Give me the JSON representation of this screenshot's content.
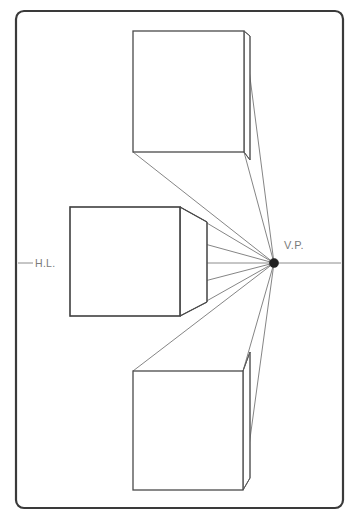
{
  "diagram": {
    "canvas": {
      "width": 357,
      "height": 519,
      "background": "#ffffff"
    },
    "frame": {
      "name": "page-border",
      "x": 16,
      "y": 11,
      "width": 327,
      "height": 497,
      "corner_radius": 8,
      "stroke": "#3a3a3a",
      "stroke_width": 2.2
    },
    "labels": {
      "vanishing_point": "V.P.",
      "horizon_line": "H.L."
    },
    "colors": {
      "frame": "#3a3a3a",
      "cube_stroke": "#4a4a4a",
      "ray_stroke": "#6f6f6f",
      "horizon_stroke": "#8c8c8c",
      "label_text": "#7b7b7b",
      "vp_dot": "#202020",
      "background": "#ffffff"
    },
    "vanishing_point": {
      "x": 274,
      "y": 263,
      "radius": 4.6
    },
    "horizon": {
      "y": 263,
      "x_start": 18,
      "x_end": 341,
      "label_gap_start": 33,
      "label_gap_end": 70,
      "label_x": 51,
      "label_y": 266
    },
    "vp_label_position": {
      "x": 284,
      "y": 249
    },
    "cubes": [
      {
        "name": "cube-above-horizon",
        "position": "above",
        "front_face": {
          "left": 133,
          "top": 31,
          "right": 244,
          "bottom": 152
        },
        "back_face": {
          "left": 250,
          "top": 36,
          "right": 250,
          "bottom": 160
        },
        "visible_faces": [
          "front",
          "right-side",
          "bottom"
        ]
      },
      {
        "name": "cube-on-horizon",
        "position": "center",
        "front_face": {
          "left": 70,
          "top": 207,
          "right": 180,
          "bottom": 316
        },
        "back_face": {
          "left": 207,
          "top": 222,
          "right": 207,
          "bottom": 302
        },
        "visible_faces": [
          "front",
          "right-side",
          "top",
          "bottom"
        ]
      },
      {
        "name": "cube-below-horizon",
        "position": "below",
        "front_face": {
          "left": 133,
          "top": 371,
          "right": 243,
          "bottom": 490
        },
        "back_face": {
          "left": 250,
          "top": 352,
          "right": 250,
          "bottom": 478
        },
        "visible_faces": [
          "front",
          "right-side",
          "top"
        ]
      }
    ],
    "rays": [
      {
        "name": "ray-top-cube-tr",
        "from": [
          244,
          31
        ],
        "to": [
          274,
          263
        ]
      },
      {
        "name": "ray-top-cube-br",
        "from": [
          244,
          152
        ],
        "to": [
          274,
          263
        ]
      },
      {
        "name": "ray-top-cube-bl",
        "from": [
          133,
          152
        ],
        "to": [
          274,
          263
        ]
      },
      {
        "name": "ray-mid-cube-tr",
        "from": [
          180,
          207
        ],
        "to": [
          274,
          263
        ]
      },
      {
        "name": "ray-mid-cube-br",
        "from": [
          180,
          316
        ],
        "to": [
          274,
          263
        ]
      },
      {
        "name": "ray-mid-cube-tl-extend",
        "from": [
          70,
          207
        ],
        "to": [
          274,
          263
        ]
      },
      {
        "name": "ray-bottom-cube-tl",
        "from": [
          133,
          371
        ],
        "to": [
          274,
          263
        ]
      },
      {
        "name": "ray-bottom-cube-tr",
        "from": [
          243,
          371
        ],
        "to": [
          274,
          263
        ]
      },
      {
        "name": "ray-bottom-cube-br",
        "from": [
          243,
          490
        ],
        "to": [
          274,
          263
        ]
      }
    ]
  }
}
